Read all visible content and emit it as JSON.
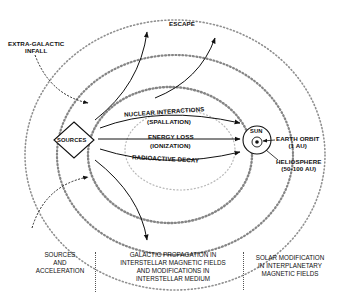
{
  "diagram": {
    "labels": {
      "extra_galactic": [
        "EXTRA-GALACTIC",
        "INFALL"
      ],
      "escape": "ESCAPE",
      "nuclear": "NUCLEAR INTERACTIONS",
      "spallation": "(SPALLATION)",
      "energy_loss": "ENERGY LOSS",
      "ionization": "(IONIZATION)",
      "radioactive": "RADIOACTIVE DECAY",
      "sources": "SOURCES",
      "sun": "SUN",
      "earth_orbit": "EARTH ORBIT",
      "earth_orbit_sub": "(1 AU)",
      "heliosphere": "HELIOSPHERE",
      "heliosphere_sub": "(50-100 AU)"
    },
    "footer": {
      "col1": [
        "SOURCES",
        "AND",
        "ACCELERATION"
      ],
      "col2": [
        "GALACTIC PROPAGATION IN",
        "INTERSTELLAR MAGNETIC FIELDS",
        "AND MODIFICATIONS IN",
        "INTERSTELLAR MEDIUM"
      ],
      "col3": [
        "SOLAR MODIFICATION",
        "IN INTERPLANETARY",
        "MAGNETIC FIELDS"
      ]
    },
    "colors": {
      "ink": "#111111",
      "background": "#ffffff"
    }
  }
}
